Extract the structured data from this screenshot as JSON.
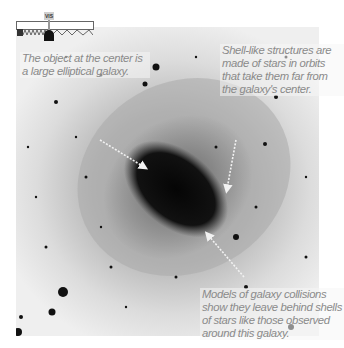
{
  "figure": {
    "captions": {
      "center": "The object at the center is a large elliptical galaxy.",
      "shells": "Shell-like structures are made of stars in orbits that take them far from the galaxy's center.",
      "models": "Models of galaxy collisions show they leave behind shells of stars like those observed around this galaxy."
    },
    "spectrum_indicator": {
      "band_label": "VIS",
      "icon": "observatory-dome-icon"
    },
    "colors": {
      "caption_text": "#8a8a8a",
      "arrow": "#f2f2f2",
      "galaxy_core": "#0a0a0a"
    }
  }
}
